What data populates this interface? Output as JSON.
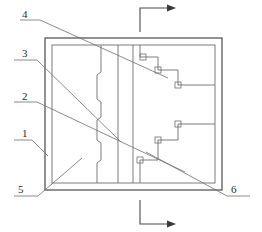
{
  "figure": {
    "type": "engineering-line-drawing",
    "title": "",
    "background_color": "#ffffff",
    "line_color": "#4a4a4a",
    "thin_line_color": "#6e6e6e",
    "label_color": "#2b2b2b",
    "width": 262,
    "height": 232
  },
  "callouts": [
    {
      "id": "4",
      "label": "4",
      "x": 22,
      "y": 9,
      "leader_start": [
        20,
        20
      ],
      "leader_elbow": [
        40,
        20
      ],
      "leader_end": [
        168,
        78
      ]
    },
    {
      "id": "3",
      "label": "3",
      "x": 22,
      "y": 48,
      "leader_start": [
        14,
        60
      ],
      "leader_elbow": [
        37,
        60
      ],
      "leader_end": [
        121,
        142
      ]
    },
    {
      "id": "2",
      "label": "2",
      "x": 22,
      "y": 91,
      "leader_start": [
        14,
        102
      ],
      "leader_elbow": [
        37,
        102
      ],
      "leader_end": [
        185,
        172
      ]
    },
    {
      "id": "1",
      "label": "1",
      "x": 22,
      "y": 128,
      "leader_start": [
        14,
        140
      ],
      "leader_elbow": [
        32,
        140
      ],
      "leader_end": [
        48,
        156
      ]
    },
    {
      "id": "5",
      "label": "5",
      "x": 18,
      "y": 184,
      "leader_start": [
        14,
        196
      ],
      "leader_elbow": [
        38,
        196
      ],
      "leader_end": [
        82,
        158
      ]
    },
    {
      "id": "6",
      "label": "6",
      "x": 231,
      "y": 184,
      "leader_start": [
        250,
        196
      ],
      "leader_elbow": [
        227,
        196
      ],
      "leader_end": [
        146,
        152
      ]
    }
  ],
  "section_markers": [
    {
      "name": "top-section-arrow",
      "corner": [
        140,
        7
      ],
      "vertical_to": [
        140,
        32
      ],
      "horizontal_to": [
        170,
        7
      ],
      "arrow_dir": "right"
    },
    {
      "name": "bottom-section-arrow",
      "corner": [
        140,
        224
      ],
      "vertical_to": [
        140,
        200
      ],
      "horizontal_to": [
        170,
        224
      ],
      "arrow_dir": "right"
    }
  ],
  "outer_frame": {
    "x": 45,
    "y": 38,
    "width": 177,
    "height": 152
  },
  "inner_frame": {
    "x": 52,
    "y": 45,
    "width": 163,
    "height": 138
  },
  "vertical_dividers": [
    {
      "name": "stepped-divider",
      "x": 101,
      "stepped": true
    },
    {
      "name": "plain-divider-left",
      "x": 118,
      "stepped": false
    },
    {
      "name": "plain-divider-right",
      "x": 133,
      "stepped": false
    }
  ],
  "stepped_profile_points": "101,45 101,72 97,75 97,99 101,102 101,117 97,120 97,140 101,143 101,160 97,163 97,183",
  "upper_step_path": "215,85 180,85 180,70 160,70 160,57 140,57 140,45",
  "lower_step_path": "215,124 180,124 180,140 160,140 160,160 140,160 140,183",
  "junction_squares": [
    {
      "x": 155,
      "y": 56,
      "size": 6
    },
    {
      "x": 175,
      "y": 69,
      "size": 6
    },
    {
      "x": 192,
      "y": 84,
      "size": 6
    },
    {
      "x": 192,
      "y": 118,
      "size": 6
    },
    {
      "x": 175,
      "y": 137,
      "size": 6
    },
    {
      "x": 138,
      "y": 156,
      "size": 6
    }
  ]
}
